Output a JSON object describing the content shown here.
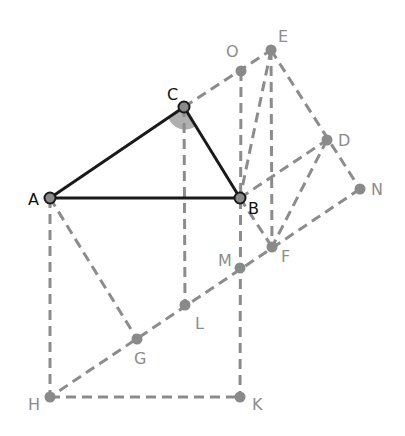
{
  "diagram": {
    "title": "",
    "colors": {
      "solid_line": "#1a1a1a",
      "dashed_line": "#8c8c8c",
      "point_fill": "#8a8a8a",
      "right_angle_marker": "#b0b0b0",
      "main_label": "#111111",
      "aux_label": "#8c8c8c"
    },
    "points": {
      "A": {
        "label": "A",
        "x": 50,
        "y": 198,
        "main": true
      },
      "B": {
        "label": "B",
        "x": 240,
        "y": 198,
        "main": true
      },
      "C": {
        "label": "C",
        "x": 184,
        "y": 107,
        "main": true
      },
      "D": {
        "label": "D",
        "x": 327,
        "y": 140,
        "main": false
      },
      "E": {
        "label": "E",
        "x": 271,
        "y": 50,
        "main": false
      },
      "F": {
        "label": "F",
        "x": 272,
        "y": 247,
        "main": false
      },
      "G": {
        "label": "G",
        "x": 137,
        "y": 339,
        "main": false
      },
      "H": {
        "label": "H",
        "x": 50,
        "y": 397,
        "main": false
      },
      "K": {
        "label": "K",
        "x": 240,
        "y": 397,
        "main": false
      },
      "L": {
        "label": "L",
        "x": 185,
        "y": 305,
        "main": false
      },
      "M": {
        "label": "M",
        "x": 240,
        "y": 268,
        "main": false
      },
      "N": {
        "label": "N",
        "x": 360,
        "y": 189,
        "main": false
      },
      "O": {
        "label": "O",
        "x": 241,
        "y": 71,
        "main": false
      }
    },
    "solid_segments": [
      [
        "A",
        "B"
      ],
      [
        "A",
        "C"
      ],
      [
        "C",
        "B"
      ]
    ],
    "dashed_segments": [
      [
        "C",
        "E"
      ],
      [
        "C",
        "L"
      ],
      [
        "O",
        "K"
      ],
      [
        "E",
        "B"
      ],
      [
        "E",
        "F"
      ],
      [
        "E",
        "N"
      ],
      [
        "B",
        "D"
      ],
      [
        "B",
        "F"
      ],
      [
        "D",
        "F"
      ],
      [
        "N",
        "H"
      ],
      [
        "A",
        "G"
      ],
      [
        "A",
        "H"
      ],
      [
        "H",
        "K"
      ]
    ],
    "right_angle_at": "C"
  }
}
